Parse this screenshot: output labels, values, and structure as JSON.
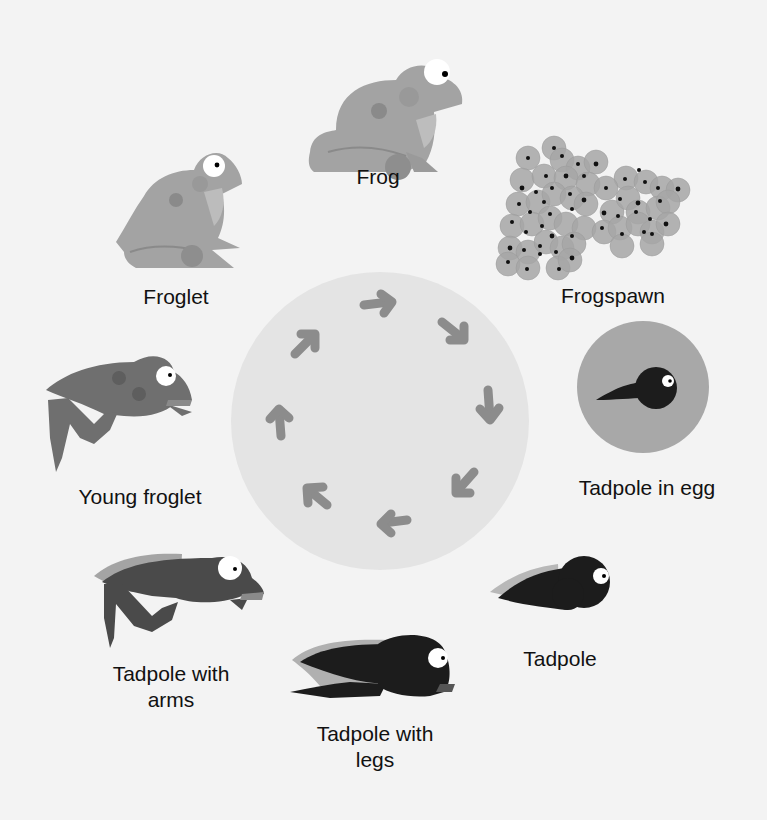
{
  "diagram": {
    "stages": [
      {
        "id": "frog",
        "label": "Frog"
      },
      {
        "id": "frogspawn",
        "label": "Frogspawn"
      },
      {
        "id": "tadpole-in-egg",
        "label": "Tadpole in egg"
      },
      {
        "id": "tadpole",
        "label": "Tadpole"
      },
      {
        "id": "tadpole-with-legs",
        "label_line1": "Tadpole with",
        "label_line2": "legs"
      },
      {
        "id": "tadpole-with-arms",
        "label_line1": "Tadpole with",
        "label_line2": "arms"
      },
      {
        "id": "young-froglet",
        "label": "Young froglet"
      },
      {
        "id": "froglet",
        "label": "Froglet"
      }
    ],
    "arrows": {
      "count": 8,
      "direction": "clockwise",
      "color": "#8c8c8c"
    },
    "colors": {
      "background": "#f3f3f3",
      "center_circle": "#e4e4e4",
      "frog_body": "#a3a3a3",
      "young_froglet_body": "#6f6f6f",
      "tadpole_body": "#1c1c1c",
      "egg_jelly": "#a8a8a8"
    }
  }
}
